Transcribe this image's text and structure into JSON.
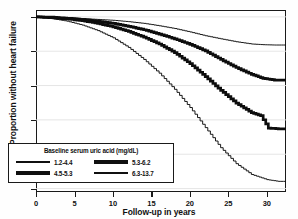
{
  "chart_data": {
    "type": "line",
    "title": "",
    "xlabel": "Follow-up in years",
    "ylabel": "Proportion without heart failure",
    "xlim": [
      0,
      32.5
    ],
    "ylim": [
      0.898,
      1.004
    ],
    "xticks": [
      "0",
      "5",
      "10",
      "15",
      "20",
      "25",
      "30"
    ],
    "xtick_values": [
      0,
      5,
      10,
      15,
      20,
      25,
      30
    ],
    "yticks": [
      "1.00",
      "0.98",
      "0.96",
      "0.94",
      "0.92",
      "0.90"
    ],
    "ytick_values": [
      1.0,
      0.98,
      0.96,
      0.94,
      0.92,
      0.9
    ],
    "grid": "horizontal",
    "legend_position": "lower-left",
    "legend_title": "Baseline serum uric acid (mg/dL)",
    "series": [
      {
        "name": "1.2-4.4",
        "style": "thin",
        "points": [
          [
            0,
            1.0
          ],
          [
            2,
            1.0
          ],
          [
            4,
            0.9995
          ],
          [
            6,
            0.999
          ],
          [
            8,
            0.9985
          ],
          [
            10,
            0.998
          ],
          [
            12,
            0.9972
          ],
          [
            14,
            0.9962
          ],
          [
            16,
            0.9948
          ],
          [
            18,
            0.9932
          ],
          [
            20,
            0.9912
          ],
          [
            22,
            0.989
          ],
          [
            24,
            0.9872
          ],
          [
            26,
            0.9855
          ],
          [
            28,
            0.9842
          ],
          [
            29.5,
            0.9838
          ],
          [
            31,
            0.9836
          ],
          [
            32.5,
            0.9836
          ]
        ]
      },
      {
        "name": "4.5-5.3",
        "style": "thick",
        "points": [
          [
            0,
            1.0
          ],
          [
            2,
            0.9998
          ],
          [
            4,
            0.9992
          ],
          [
            6,
            0.9985
          ],
          [
            8,
            0.9975
          ],
          [
            10,
            0.9962
          ],
          [
            12,
            0.9945
          ],
          [
            14,
            0.9925
          ],
          [
            16,
            0.99
          ],
          [
            18,
            0.9872
          ],
          [
            20,
            0.984
          ],
          [
            22,
            0.9802
          ],
          [
            24,
            0.9752
          ],
          [
            26,
            0.9705
          ],
          [
            28,
            0.9665
          ],
          [
            29.5,
            0.9642
          ],
          [
            31,
            0.9632
          ],
          [
            32.5,
            0.9632
          ]
        ]
      },
      {
        "name": "5.3-6.2",
        "style": "thick",
        "points": [
          [
            0,
            1.0
          ],
          [
            2,
            0.9995
          ],
          [
            4,
            0.9988
          ],
          [
            6,
            0.9978
          ],
          [
            8,
            0.9962
          ],
          [
            10,
            0.9942
          ],
          [
            12,
            0.9915
          ],
          [
            14,
            0.9882
          ],
          [
            16,
            0.9842
          ],
          [
            18,
            0.9792
          ],
          [
            20,
            0.9728
          ],
          [
            22,
            0.9652
          ],
          [
            24,
            0.9572
          ],
          [
            26,
            0.9498
          ],
          [
            28,
            0.9442
          ],
          [
            29.2,
            0.9425
          ],
          [
            30.2,
            0.9352
          ],
          [
            31.5,
            0.9348
          ],
          [
            32.5,
            0.9348
          ]
        ]
      },
      {
        "name": "6.3-13.7",
        "style": "thin",
        "points": [
          [
            0,
            1.0
          ],
          [
            2,
            0.999
          ],
          [
            4,
            0.9975
          ],
          [
            6,
            0.9952
          ],
          [
            8,
            0.992
          ],
          [
            10,
            0.9878
          ],
          [
            12,
            0.9822
          ],
          [
            14,
            0.9752
          ],
          [
            16,
            0.9672
          ],
          [
            18,
            0.9578
          ],
          [
            20,
            0.9472
          ],
          [
            22,
            0.9355
          ],
          [
            24,
            0.9238
          ],
          [
            26,
            0.9145
          ],
          [
            28,
            0.9082
          ],
          [
            30,
            0.9052
          ],
          [
            31.5,
            0.9042
          ],
          [
            32.5,
            0.9042
          ]
        ]
      }
    ]
  },
  "legend": {
    "title": "Baseline serum uric acid (mg/dL)",
    "entries": [
      {
        "label": "1.2-4.4",
        "style": "med"
      },
      {
        "label": "4.5-5.3",
        "style": "thick"
      },
      {
        "label": "5.3-6.2",
        "style": "thick"
      },
      {
        "label": "6.3-13.7",
        "style": "thin"
      }
    ]
  }
}
